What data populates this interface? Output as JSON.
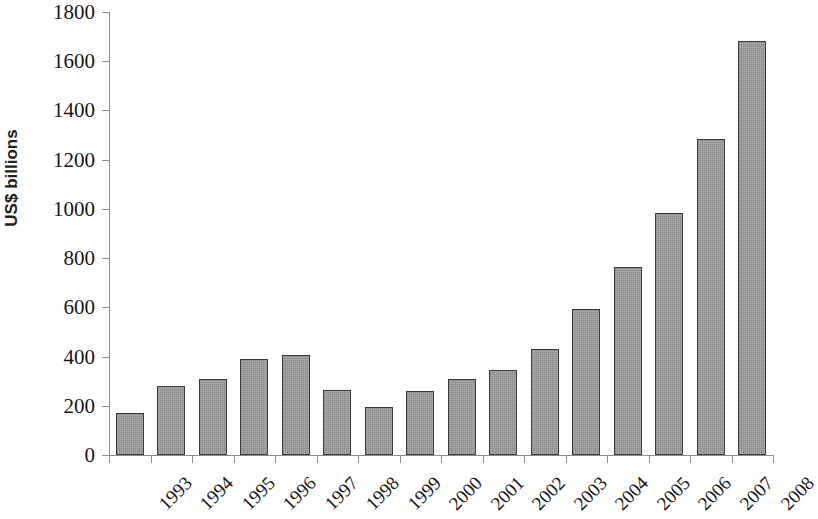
{
  "chart_data": {
    "type": "bar",
    "title": "",
    "subtitle": "",
    "xlabel": "",
    "ylabel": "US$ billions",
    "ylim": [
      0,
      1800
    ],
    "ytick_step": 200,
    "yticks": [
      0,
      200,
      400,
      600,
      800,
      1000,
      1200,
      1400,
      1600,
      1800
    ],
    "ytick_labels": [
      "0",
      "200",
      "400",
      "600",
      "800",
      "1000",
      "1200",
      "1400",
      "1600",
      "1800"
    ],
    "grid": false,
    "legend": false,
    "legend_position": "none",
    "categories": [
      "1993",
      "1994",
      "1995",
      "1996",
      "1997",
      "1998",
      "1999",
      "2000",
      "2001",
      "2002",
      "2003",
      "2004",
      "2005",
      "2006",
      "2007",
      "2008"
    ],
    "values": [
      170,
      280,
      310,
      390,
      405,
      265,
      195,
      260,
      308,
      345,
      432,
      592,
      765,
      982,
      1285,
      1683
    ],
    "series": [
      {
        "name": "US$ billions",
        "values": [
          170,
          280,
          310,
          390,
          405,
          265,
          195,
          260,
          308,
          345,
          432,
          592,
          765,
          982,
          1285,
          1683
        ]
      }
    ],
    "bar_color": "#9b9b9b",
    "bar_border_color": "#3a3a3a",
    "axis_color": "#8d8d8d",
    "text_color": "#171717",
    "background_color": "#ffffff",
    "xtick_label_rotation": -45
  }
}
